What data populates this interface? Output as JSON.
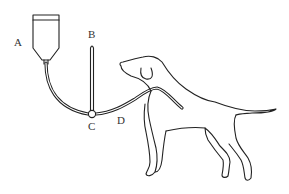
{
  "figure": {
    "type": "apparatus diagram",
    "labels": [
      {
        "id": "A",
        "text": "A",
        "x": 17,
        "y": 46,
        "refers_to": "reservoir bottle"
      },
      {
        "id": "B",
        "text": "B",
        "x": 89,
        "y": 37,
        "refers_to": "vertical manometer tube"
      },
      {
        "id": "C",
        "text": "C",
        "x": 88,
        "y": 131,
        "refers_to": "three-way junction"
      },
      {
        "id": "D",
        "text": "D",
        "x": 118,
        "y": 124,
        "refers_to": "tube to animal"
      }
    ],
    "colors": {
      "line": "#222222",
      "label": "#333333",
      "background": "#ffffff"
    }
  }
}
